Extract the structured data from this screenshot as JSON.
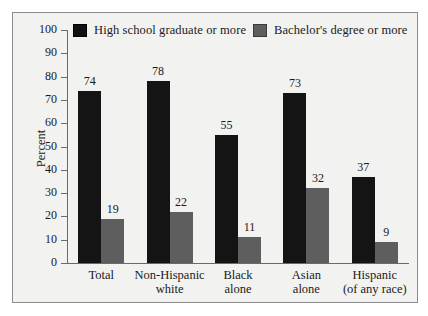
{
  "chart_data": {
    "type": "bar",
    "title": "",
    "xlabel": "",
    "ylabel": "Percent",
    "ylim": [
      0,
      100
    ],
    "ytick_step": 10,
    "yticks": [
      100,
      90,
      80,
      70,
      60,
      50,
      40,
      30,
      20,
      10,
      0
    ],
    "grid": false,
    "legend_position": "top",
    "categories": [
      "Total",
      "Non-Hispanic white",
      "Black alone",
      "Asian alone",
      "Hispanic (of any race)"
    ],
    "category_lines": [
      [
        "Total"
      ],
      [
        "Non-Hispanic",
        "white"
      ],
      [
        "Black",
        "alone"
      ],
      [
        "Asian",
        "alone"
      ],
      [
        "Hispanic",
        "(of any race)"
      ]
    ],
    "series": [
      {
        "name": "High school graduate or more",
        "color": "#141414",
        "values": [
          74,
          78,
          55,
          73,
          37
        ]
      },
      {
        "name": "Bachelor's degree or more",
        "color": "#5e5e5e",
        "values": [
          19,
          22,
          11,
          32,
          9
        ]
      }
    ]
  },
  "legend": {
    "entries": [
      {
        "label": "High school graduate or more",
        "swatch": "black"
      },
      {
        "label": "Bachelor's degree or more",
        "swatch": "gray"
      }
    ]
  },
  "colors": {
    "series_black": "#141414",
    "series_gray": "#5e5e5e",
    "axis": "#6a6a6a",
    "frame": "#8d8d8d",
    "background": "#f2f2f0",
    "text": "#1a1a1a"
  }
}
